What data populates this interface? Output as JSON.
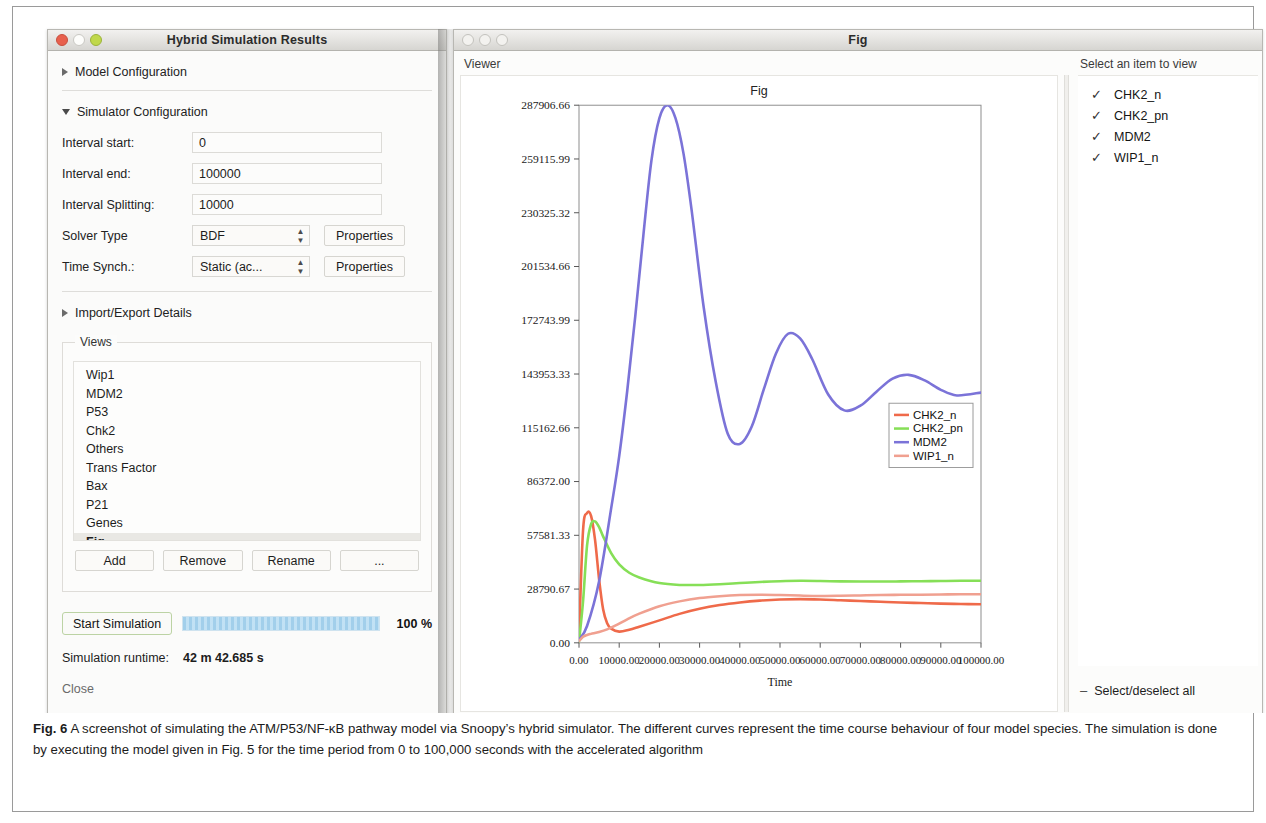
{
  "sim_window": {
    "title": "Hybrid Simulation Results",
    "sections": {
      "model_config": "Model Configuration",
      "simulator_config": "Simulator Configuration",
      "import_export": "Import/Export Details"
    },
    "fields": [
      {
        "label": "Interval start:",
        "value": "0"
      },
      {
        "label": "Interval end:",
        "value": "100000"
      },
      {
        "label": "Interval Splitting:",
        "value": "10000"
      }
    ],
    "solver": {
      "label": "Solver Type",
      "value": "BDF",
      "properties_label": "Properties"
    },
    "time_synch": {
      "label": "Time Synch.:",
      "value": "Static (ac...",
      "properties_label": "Properties"
    },
    "views": {
      "legend": "Views",
      "items": [
        "Wip1",
        "MDM2",
        "P53",
        "Chk2",
        "Others",
        "Trans Factor",
        "Bax",
        "P21",
        "Genes",
        "Fig"
      ],
      "selected": "Fig",
      "buttons": [
        "Add",
        "Remove",
        "Rename",
        "..."
      ]
    },
    "run": {
      "start_label": "Start Simulation",
      "progress_percent": "100 %",
      "progress_value": 100,
      "runtime_label": "Simulation runtime:",
      "runtime_value": "42 m 42.685 s",
      "close_label": "Close"
    }
  },
  "fig_window": {
    "title": "Fig",
    "viewer_label": "Viewer",
    "select_title": "Select an item to view",
    "species": [
      {
        "name": "CHK2_n",
        "checked": true
      },
      {
        "name": "CHK2_pn",
        "checked": true
      },
      {
        "name": "MDM2",
        "checked": true
      },
      {
        "name": "WIP1_n",
        "checked": true
      }
    ],
    "select_all_label": "Select/deselect all",
    "check_glyph": "✓",
    "dash_glyph": "–"
  },
  "chart_data": {
    "type": "line",
    "title": "Fig",
    "xlabel": "Time",
    "ylabel": "",
    "xlim": [
      0,
      100000
    ],
    "ylim": [
      0,
      287906.66
    ],
    "grid": false,
    "legend_position": "right-inside",
    "xticks": [
      0,
      10000,
      20000,
      30000,
      40000,
      50000,
      60000,
      70000,
      80000,
      90000,
      100000
    ],
    "xtick_labels": [
      "0.00",
      "10000.00",
      "20000.00",
      "30000.00",
      "40000.00",
      "50000.00",
      "60000.00",
      "70000.00",
      "80000.00",
      "90000.00",
      "100000.00"
    ],
    "yticks": [
      0,
      28790.67,
      57581.33,
      86372.0,
      115162.66,
      143953.33,
      172743.99,
      201534.66,
      230325.32,
      259115.99,
      287906.66
    ],
    "ytick_labels": [
      "0.00",
      "28790.67",
      "57581.33",
      "86372.00",
      "115162.66",
      "143953.33",
      "172743.99",
      "201534.66",
      "230325.32",
      "259115.99",
      "287906.66"
    ],
    "series": [
      {
        "name": "CHK2_n",
        "color": "#ef6a4a",
        "x": [
          0,
          1000,
          2000,
          3000,
          4000,
          5000,
          6000,
          7000,
          8000,
          10000,
          12500,
          15000,
          20000,
          25000,
          30000,
          35000,
          40000,
          45000,
          50000,
          55000,
          60000,
          65000,
          70000,
          75000,
          80000,
          85000,
          90000,
          95000,
          100000
        ],
        "y": [
          2000,
          60000,
          69500,
          68000,
          55000,
          34000,
          18000,
          10500,
          7600,
          6000,
          7000,
          8600,
          12000,
          15500,
          18200,
          20200,
          21600,
          22600,
          23200,
          23400,
          23200,
          22800,
          22400,
          22000,
          21600,
          21300,
          21000,
          20800,
          20600
        ]
      },
      {
        "name": "CHK2_pn",
        "color": "#86df57",
        "x": [
          0,
          1000,
          2000,
          3000,
          4000,
          5000,
          6000,
          8000,
          10000,
          12500,
          15000,
          20000,
          25000,
          30000,
          35000,
          40000,
          45000,
          50000,
          55000,
          60000,
          65000,
          70000,
          75000,
          80000,
          85000,
          90000,
          95000,
          100000
        ],
        "y": [
          600,
          22000,
          52000,
          63500,
          65000,
          62000,
          57000,
          48000,
          42000,
          37500,
          35000,
          32000,
          31000,
          31000,
          31400,
          32000,
          32600,
          33000,
          33200,
          33100,
          32900,
          32800,
          32800,
          32900,
          33000,
          33100,
          33200,
          33200
        ]
      },
      {
        "name": "MDM2",
        "color": "#7b73d8",
        "x": [
          0,
          2000,
          5000,
          8000,
          10000,
          12000,
          14000,
          16000,
          18000,
          20000,
          22000,
          24000,
          26000,
          28000,
          31000,
          34000,
          37000,
          40000,
          43000,
          46000,
          49000,
          52000,
          55000,
          58000,
          62000,
          66000,
          70000,
          74000,
          78000,
          82000,
          86000,
          90000,
          94000,
          100000
        ],
        "y": [
          1500,
          9000,
          33000,
          72000,
          100000,
          135000,
          175000,
          218000,
          258000,
          281000,
          287900,
          281000,
          262000,
          232000,
          180000,
          140000,
          112000,
          106500,
          116000,
          136000,
          155000,
          165500,
          163000,
          152000,
          133000,
          124500,
          127000,
          134500,
          141500,
          143500,
          140500,
          135500,
          132500,
          134000
        ]
      },
      {
        "name": "WIP1_n",
        "color": "#f0a090",
        "x": [
          0,
          1000,
          2000,
          3000,
          5000,
          7000,
          9000,
          12000,
          15000,
          20000,
          25000,
          30000,
          35000,
          40000,
          45000,
          50000,
          55000,
          60000,
          65000,
          70000,
          75000,
          80000,
          85000,
          90000,
          95000,
          100000
        ],
        "y": [
          900,
          3200,
          4200,
          4800,
          5800,
          7200,
          9200,
          12600,
          15600,
          19600,
          22200,
          24000,
          25000,
          25600,
          25800,
          25600,
          25300,
          25100,
          25200,
          25400,
          25600,
          25700,
          25800,
          25900,
          26000,
          26000
        ]
      }
    ]
  },
  "caption": {
    "fig_label": "Fig. 6",
    "text": "A screenshot of simulating the ATM/P53/NF-κB pathway model via Snoopy’s hybrid simulator. The different curves represent the time course behaviour of four model species. The simulation is done by executing the model given in Fig. 5 for the time period from 0 to 100,000 seconds with the accelerated algorithm"
  }
}
